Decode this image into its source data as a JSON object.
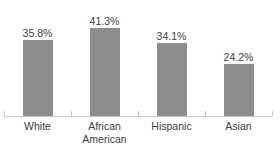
{
  "chart_data": {
    "type": "bar",
    "title": "",
    "subtitle": "",
    "xlabel": "",
    "ylabel": "",
    "ylim": [
      0,
      45
    ],
    "grid": false,
    "legend": false,
    "categories": [
      "White",
      "African American",
      "Hispanic",
      "Asian"
    ],
    "values": [
      35.8,
      41.3,
      34.1,
      24.2
    ],
    "value_labels": [
      "35.8%",
      "41.3%",
      "34.1%",
      "24.2%"
    ],
    "bar_color": "#8d8d8d",
    "label_color": "#3d3d3d",
    "axis_color": "#c9c9c9",
    "background_color": "#ffffff"
  },
  "axis": {
    "baseline_visible": true,
    "tick_count": 5
  },
  "categories": [
    {
      "line1": "White",
      "line2": "",
      "value_label": "35.8%",
      "value": 35.8
    },
    {
      "line1": "African",
      "line2": "American",
      "value_label": "41.3%",
      "value": 41.3
    },
    {
      "line1": "Hispanic",
      "line2": "",
      "value_label": "34.1%",
      "value": 34.1
    },
    {
      "line1": "Asian",
      "line2": "",
      "value_label": "24.2%",
      "value": 24.2
    }
  ],
  "title_strip": {
    "text": ""
  }
}
